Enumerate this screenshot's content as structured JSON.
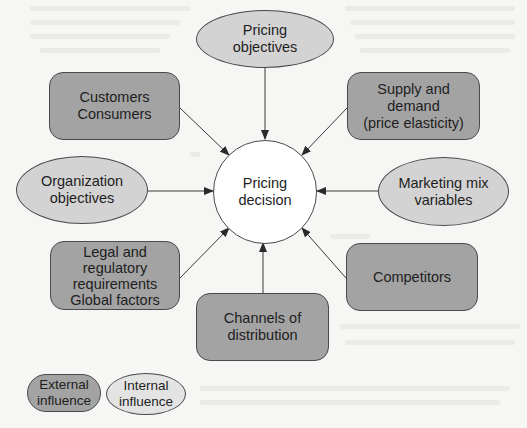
{
  "diagram": {
    "center": {
      "label": "Pricing\ndecision"
    },
    "nodes": {
      "pricing_objectives": {
        "label": "Pricing\nobjectives",
        "type": "internal"
      },
      "customers": {
        "label": "Customers\nConsumers",
        "type": "external"
      },
      "supply_demand": {
        "label": "Supply and\ndemand\n(price elasticity)",
        "type": "external"
      },
      "organization_objectives": {
        "label": "Organization\nobjectives",
        "type": "internal"
      },
      "marketing_mix": {
        "label": "Marketing mix\nvariables",
        "type": "internal"
      },
      "legal": {
        "label": "Legal and\nregulatory\nrequirements\nGlobal factors",
        "type": "external"
      },
      "channels": {
        "label": "Channels of\ndistribution",
        "type": "external"
      },
      "competitors": {
        "label": "Competitors",
        "type": "external"
      }
    },
    "legend": {
      "external": "External\ninfluence",
      "internal": "Internal\ninfluence"
    },
    "colors": {
      "external_fill": "#a3a3a3",
      "internal_fill": "#d3d3d3",
      "center_fill": "#ffffff",
      "stroke": "#4a4a4a"
    }
  }
}
